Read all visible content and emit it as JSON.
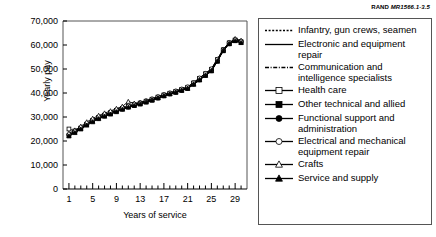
{
  "source_credit": {
    "brand": "RAND",
    "id": "MR1566.1-3.5"
  },
  "chart_data": {
    "type": "line",
    "title": "",
    "xlabel": "Years of service",
    "ylabel": "Yearly pay",
    "xlim": [
      0,
      31
    ],
    "ylim": [
      0,
      70000
    ],
    "grid": false,
    "legend_position": "right",
    "x_ticks_major": [
      1,
      5,
      9,
      13,
      17,
      21,
      25,
      29
    ],
    "x_tick_labels": [
      "1",
      "5",
      "9",
      "13",
      "17",
      "21",
      "25",
      "29"
    ],
    "x_ticks_minor_step": 1,
    "y_ticks": [
      0,
      10000,
      20000,
      30000,
      40000,
      50000,
      60000,
      70000
    ],
    "y_tick_labels": [
      "0",
      "10,000",
      "20,000",
      "30,000",
      "40,000",
      "50,000",
      "60,000",
      "70,000"
    ],
    "x": [
      1,
      2,
      3,
      4,
      5,
      6,
      7,
      8,
      9,
      10,
      11,
      12,
      13,
      14,
      15,
      16,
      17,
      18,
      19,
      20,
      21,
      22,
      23,
      24,
      25,
      26,
      27,
      28,
      29,
      30
    ],
    "series": [
      {
        "name": "Infantry, gun crews, seamen",
        "marker": "none",
        "line": "dotted",
        "values": [
          22300,
          23600,
          25000,
          26600,
          28000,
          29300,
          30300,
          31200,
          32200,
          33200,
          34100,
          34800,
          35400,
          36200,
          37000,
          37900,
          38800,
          39600,
          40300,
          41100,
          41900,
          43600,
          45400,
          47300,
          49200,
          53200,
          57600,
          60500,
          61800,
          61200
        ]
      },
      {
        "name": "Electronic and equipment repair",
        "marker": "none",
        "line": "solid",
        "values": [
          22600,
          24000,
          25500,
          27200,
          28700,
          29900,
          30900,
          31900,
          32900,
          33700,
          34500,
          35200,
          35900,
          36700,
          37500,
          38400,
          39300,
          40000,
          40800,
          41600,
          42500,
          44300,
          46200,
          48100,
          50000,
          54000,
          58100,
          61000,
          62200,
          61500
        ]
      },
      {
        "name": "Communication and intelligence specialists",
        "marker": "none",
        "line": "dashdot",
        "values": [
          22100,
          23500,
          25100,
          26900,
          28500,
          29700,
          30700,
          31600,
          32600,
          33500,
          34300,
          35000,
          35700,
          36500,
          37300,
          38100,
          39000,
          39800,
          40500,
          41300,
          42100,
          43900,
          45700,
          47600,
          49500,
          53600,
          57900,
          60700,
          62000,
          61300
        ]
      },
      {
        "name": "Health care",
        "marker": "open-square",
        "line": "solid",
        "values": [
          25000,
          24200,
          25400,
          27000,
          28400,
          29600,
          30600,
          31500,
          32500,
          33400,
          34200,
          34900,
          35500,
          36300,
          37100,
          38000,
          38900,
          39700,
          40400,
          41200,
          42000,
          43800,
          45600,
          47500,
          49400,
          53400,
          57800,
          60600,
          61900,
          61100
        ]
      },
      {
        "name": "Other technical and allied",
        "marker": "filled-square",
        "line": "solid",
        "values": [
          22400,
          23800,
          25300,
          27000,
          28600,
          29800,
          30800,
          31800,
          32800,
          33600,
          34400,
          35100,
          35800,
          36600,
          37400,
          38300,
          39200,
          39900,
          40700,
          41500,
          42400,
          44200,
          46100,
          48000,
          49900,
          53900,
          58000,
          60900,
          62100,
          61400
        ]
      },
      {
        "name": "Functional support and administration",
        "marker": "filled-circle",
        "line": "solid",
        "values": [
          22200,
          23700,
          25200,
          26800,
          28300,
          29500,
          30500,
          31400,
          32400,
          33300,
          34100,
          34800,
          35500,
          36300,
          37100,
          37900,
          38800,
          39600,
          40300,
          41100,
          41900,
          43700,
          45500,
          47400,
          49300,
          53300,
          57700,
          60500,
          61800,
          61000
        ]
      },
      {
        "name": "Electrical and mechanical equipment repair",
        "marker": "open-circle",
        "line": "solid",
        "values": [
          22700,
          24100,
          25600,
          27300,
          28800,
          30000,
          31000,
          32000,
          33000,
          33800,
          34600,
          35300,
          36000,
          36800,
          37600,
          38500,
          39400,
          40100,
          40900,
          41700,
          42600,
          44400,
          46300,
          48200,
          50100,
          54100,
          58200,
          61100,
          62300,
          61600
        ]
      },
      {
        "name": "Crafts",
        "marker": "open-triangle",
        "line": "solid",
        "values": [
          23200,
          24500,
          26100,
          27900,
          29400,
          30600,
          31600,
          32500,
          33500,
          34400,
          36400,
          35700,
          36000,
          36600,
          37200,
          38000,
          38900,
          39700,
          40400,
          41200,
          42000,
          43800,
          45600,
          47500,
          49400,
          53400,
          57800,
          60600,
          62600,
          61900
        ]
      },
      {
        "name": "Service and supply",
        "marker": "filled-triangle",
        "line": "solid",
        "values": [
          22000,
          23400,
          24900,
          26500,
          27900,
          29200,
          30200,
          31100,
          32100,
          33100,
          34000,
          34700,
          35300,
          36100,
          36900,
          37800,
          38700,
          39500,
          40200,
          41000,
          41800,
          43500,
          45300,
          47200,
          49100,
          53100,
          57500,
          60400,
          61700,
          60900
        ]
      }
    ]
  }
}
